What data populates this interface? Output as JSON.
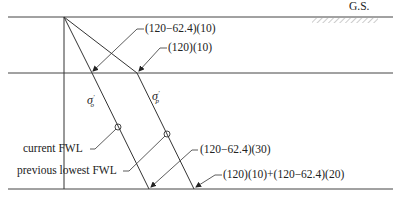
{
  "diagram": {
    "ground_surface_label": "G.S.",
    "labels": {
      "sigma_o_symbol": "σ",
      "sigma_o_prime": "′",
      "sigma_o_sub": "o",
      "sigma_p_symbol": "σ",
      "sigma_p_prime": "′",
      "sigma_p_sub": "p",
      "current_fwl": "current FWL",
      "previous_lowest_fwl": "previous lowest FWL"
    },
    "annotations": {
      "sigma_o_at_mid": "(120−62.4)(10)",
      "sigma_p_at_mid": "(120)(10)",
      "sigma_o_at_bottom": "(120−62.4)(30)",
      "sigma_p_at_bottom": "(120)(10)+(120−62.4)(20)"
    },
    "colors": {
      "line": "#333333",
      "text": "#222222",
      "hatch": "#9a9a9a"
    }
  }
}
